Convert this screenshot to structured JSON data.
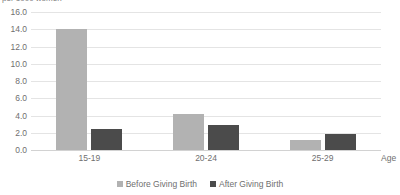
{
  "caption": "per 1000 women",
  "axis_title": "Age",
  "legend": {
    "before_label": "Before Giving Birth",
    "after_label": "After Giving Birth"
  },
  "colors": {
    "before": "#b2b2b2",
    "after": "#4b4b4b",
    "gridline": "#e4e4e4",
    "baseline": "#d2d2d2",
    "text": "#6f6f6f"
  },
  "chart_data": {
    "type": "bar",
    "title": "",
    "subtitle": "per 1000 women",
    "xlabel": "Age",
    "ylabel": "",
    "categories": [
      "15-19",
      "20-24",
      "25-29"
    ],
    "series": [
      {
        "name": "Before Giving Birth",
        "values": [
          14.0,
          4.2,
          1.2
        ],
        "color": "#b2b2b2"
      },
      {
        "name": "After Giving Birth",
        "values": [
          2.4,
          2.9,
          1.8
        ],
        "color": "#4b4b4b"
      }
    ],
    "ylim": [
      0.0,
      16.0
    ],
    "yticks": [
      "16.0",
      "14.0",
      "12.0",
      "10.0",
      "8.0",
      "6.0",
      "4.0",
      "2.0",
      "0.0"
    ],
    "ytick_values": [
      16.0,
      14.0,
      12.0,
      10.0,
      8.0,
      6.0,
      4.0,
      2.0,
      0.0
    ],
    "grid": true,
    "legend_position": "bottom"
  }
}
